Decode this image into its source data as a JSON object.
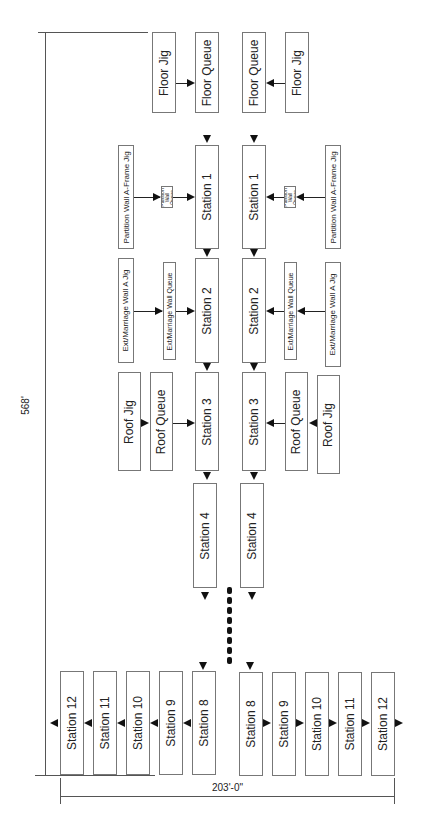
{
  "diagram": {
    "type": "production line layout (rotated 90°)",
    "dimensions": {
      "length": "568'",
      "width": "203'-0\""
    },
    "feeders_top": {
      "floor_jig": "Floor Jig",
      "floor_queue": "Floor Queue",
      "partition_jig": "Partition Wall A-Frame Jig",
      "partition_queue": "Partition Wall Queue",
      "ext_jig": "Ext/Marriage Wall A Jig",
      "ext_queue": "Ext/Marriage Wall Queue",
      "roof_jig": "Roof Jig",
      "roof_queue": "Roof Queue"
    },
    "stations": {
      "s1": "Station 1",
      "s2": "Station 2",
      "s3": "Station 3",
      "s4": "Station 4",
      "s8": "Station 8",
      "s9": "Station 9",
      "s10": "Station 10",
      "s11": "Station 11",
      "s12": "Station 12"
    }
  }
}
